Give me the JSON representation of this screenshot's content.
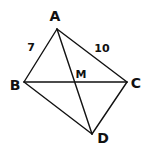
{
  "diagram": {
    "type": "geometry-quadrilateral",
    "stroke_color": "#111111",
    "background": "#ffffff",
    "points": {
      "A": {
        "label": "A",
        "x": 57,
        "y": 29,
        "label_x": 55,
        "label_y": 17
      },
      "B": {
        "label": "B",
        "x": 24,
        "y": 82,
        "label_x": 15,
        "label_y": 86
      },
      "C": {
        "label": "C",
        "x": 127,
        "y": 82,
        "label_x": 136,
        "label_y": 84
      },
      "D": {
        "label": "D",
        "x": 92,
        "y": 134,
        "label_x": 103,
        "label_y": 139
      },
      "M": {
        "label": "M",
        "x": 73,
        "y": 82,
        "label_x": 81,
        "label_y": 75
      }
    },
    "segments": [
      {
        "from": "A",
        "to": "B"
      },
      {
        "from": "A",
        "to": "C"
      },
      {
        "from": "B",
        "to": "D"
      },
      {
        "from": "C",
        "to": "D"
      },
      {
        "from": "B",
        "to": "C"
      },
      {
        "from": "A",
        "to": "D"
      }
    ],
    "lengths": [
      {
        "segment": "AB",
        "label": "7",
        "x": 31,
        "y": 48
      },
      {
        "segment": "AC",
        "label": "10",
        "x": 102,
        "y": 49
      }
    ]
  }
}
